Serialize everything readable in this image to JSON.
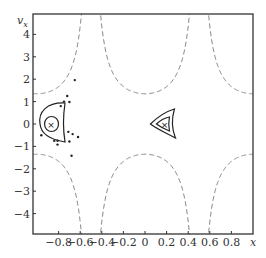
{
  "chart_data": {
    "type": "contour",
    "title": "",
    "xlabel": "x",
    "ylabel": "v_x",
    "xlim": [
      -1.04,
      1.0
    ],
    "ylim": [
      -4.9,
      4.9
    ],
    "grid": false,
    "legend": null,
    "x_ticks": [
      -0.8,
      -0.6,
      -0.4,
      -0.2,
      0,
      0.2,
      0.4,
      0.6,
      0.8
    ],
    "x_tick_labels": [
      "−0.8",
      "−0.6",
      "−0.4",
      "−0.2",
      "0",
      "0.2",
      "0.4",
      "0.6",
      "0.8"
    ],
    "y_ticks": [
      4,
      3,
      2,
      1,
      0,
      -1,
      -2,
      -3,
      -4
    ],
    "y_tick_labels": [
      "4",
      "3",
      "2",
      "1",
      "0",
      "−1",
      "−2",
      "−3",
      "−4"
    ],
    "separatrix_dashed": {
      "description": "Dashed boundary curves diverging near x≈±0.5, minimum |v_x|≈1.35 at x≈0 and x≈±1",
      "asymptotes_x": [
        -0.51,
        0.5
      ],
      "min_abs_vx": 1.35,
      "style": "dashed gray"
    },
    "contour_centers": [
      {
        "name": "left-trap",
        "x": -0.87,
        "y": 0.0,
        "marker": "×",
        "levels": 2
      },
      {
        "name": "right-trap",
        "x": 0.18,
        "y": 0.0,
        "marker": "×",
        "levels": 2
      }
    ],
    "scatter_points": [
      {
        "x": -0.65,
        "y": 1.96
      },
      {
        "x": -0.72,
        "y": 1.25
      },
      {
        "x": -0.75,
        "y": 1.0
      },
      {
        "x": -0.7,
        "y": 0.98
      },
      {
        "x": -0.78,
        "y": 0.8
      },
      {
        "x": -0.71,
        "y": -0.35
      },
      {
        "x": -0.67,
        "y": -0.45
      },
      {
        "x": -0.96,
        "y": -0.5
      },
      {
        "x": -0.84,
        "y": -0.75
      },
      {
        "x": -0.81,
        "y": -0.75
      },
      {
        "x": -0.81,
        "y": -0.92
      },
      {
        "x": -0.7,
        "y": -0.78
      },
      {
        "x": -0.62,
        "y": -0.58
      },
      {
        "x": -0.68,
        "y": -1.42
      }
    ]
  },
  "axes": {
    "xlabel": "x",
    "ylabel_main": "v",
    "ylabel_sub": "x"
  }
}
